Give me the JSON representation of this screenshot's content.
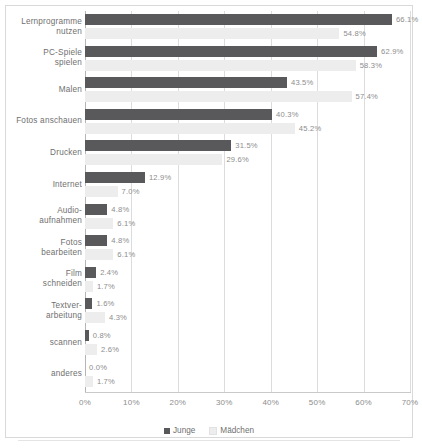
{
  "chart_data": {
    "type": "bar",
    "orientation": "horizontal",
    "title": "",
    "xlabel": "",
    "ylabel": "",
    "xlim": [
      0,
      70
    ],
    "xticks": [
      "0%",
      "10%",
      "20%",
      "30%",
      "40%",
      "50%",
      "60%",
      "70%"
    ],
    "xtick_values": [
      0,
      10,
      20,
      30,
      40,
      50,
      60,
      70
    ],
    "grid": true,
    "legend_position": "bottom",
    "categories": [
      "Lernprogramme nutzen",
      "PC-Spiele spielen",
      "Malen",
      "Fotos anschauen",
      "Drucken",
      "Internet",
      "Audio-aufnahmen",
      "Fotos bearbeiten",
      "Film schneiden",
      "Textver-arbeitung",
      "scannen",
      "anderes"
    ],
    "category_lines": [
      [
        "Lernprogramme",
        "nutzen"
      ],
      [
        "PC-Spiele",
        "spielen"
      ],
      [
        "Malen"
      ],
      [
        "Fotos anschauen"
      ],
      [
        "Drucken"
      ],
      [
        "Internet"
      ],
      [
        "Audio-",
        "aufnahmen"
      ],
      [
        "Fotos",
        "bearbeiten"
      ],
      [
        "Film",
        "schneiden"
      ],
      [
        "Textver-",
        "arbeitung"
      ],
      [
        "scannen"
      ],
      [
        "anderes"
      ]
    ],
    "series": [
      {
        "name": "Junge",
        "color": "#59595b",
        "values": [
          66.1,
          62.9,
          43.5,
          40.3,
          31.5,
          12.9,
          4.8,
          4.8,
          2.4,
          1.6,
          0.8,
          0.0
        ],
        "labels": [
          "66.1%",
          "62.9%",
          "43.5%",
          "40.3%",
          "31.5%",
          "12.9%",
          "4.8%",
          "4.8%",
          "2.4%",
          "1.6%",
          "0.8%",
          "0.0%"
        ]
      },
      {
        "name": "Mädchen",
        "color": "#ededed",
        "values": [
          54.8,
          58.3,
          57.4,
          45.2,
          29.6,
          7.0,
          6.1,
          6.1,
          1.7,
          4.3,
          2.6,
          1.7
        ],
        "labels": [
          "54.8%",
          "58.3%",
          "57.4%",
          "45.2%",
          "29.6%",
          "7.0%",
          "6.1%",
          "6.1%",
          "1.7%",
          "4.3%",
          "2.6%",
          "1.7%"
        ]
      }
    ],
    "legend": [
      "Junge",
      "Mädchen"
    ]
  }
}
